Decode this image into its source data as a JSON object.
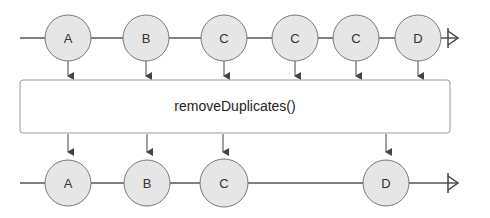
{
  "diagram": {
    "type": "marble-diagram",
    "operator": {
      "label": "removeDuplicates()"
    },
    "input_stream": {
      "marbles": [
        {
          "label": "A",
          "x": 68
        },
        {
          "label": "B",
          "x": 146
        },
        {
          "label": "C",
          "x": 224
        },
        {
          "label": "C",
          "x": 300
        },
        {
          "label": "C",
          "x": 356
        },
        {
          "label": "D",
          "x": 418
        }
      ],
      "completed": true
    },
    "output_stream": {
      "marbles": [
        {
          "label": "A",
          "x": 68
        },
        {
          "label": "B",
          "x": 146
        },
        {
          "label": "C",
          "x": 224
        },
        {
          "label": "D",
          "x": 386
        }
      ],
      "completed": true
    },
    "colors": {
      "marble_fill": "#e6e6e6",
      "stroke": "#555555",
      "box_stroke": "#999999"
    }
  }
}
